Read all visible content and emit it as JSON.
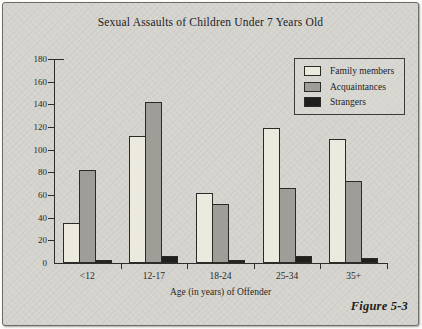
{
  "figure": {
    "caption": "Figure 5-3"
  },
  "chart_data": {
    "type": "bar",
    "title": "Sexual Assaults of Children Under 7 Years Old",
    "categories": [
      "<12",
      "12-17",
      "18-24",
      "25-34",
      "35+"
    ],
    "series": [
      {
        "name": "Family members",
        "color": "#ece9de",
        "values": [
          35,
          112,
          62,
          119,
          109
        ]
      },
      {
        "name": "Acquaintances",
        "color": "#9e9d98",
        "values": [
          82,
          142,
          52,
          66,
          72
        ]
      },
      {
        "name": "Strangers",
        "color": "#1f1f1d",
        "values": [
          3,
          6,
          3,
          6,
          4
        ]
      }
    ],
    "xlabel": "Age (in years) of Offender",
    "ylabel": "",
    "ylim": [
      0,
      180
    ],
    "ytick_step": 20,
    "grid": false,
    "legend_position": "top-right"
  },
  "colors": {
    "background": "#d4d3ce",
    "axis": "#2e2d2a",
    "text": "#23221f",
    "bar_outline": "#2b2a27"
  }
}
